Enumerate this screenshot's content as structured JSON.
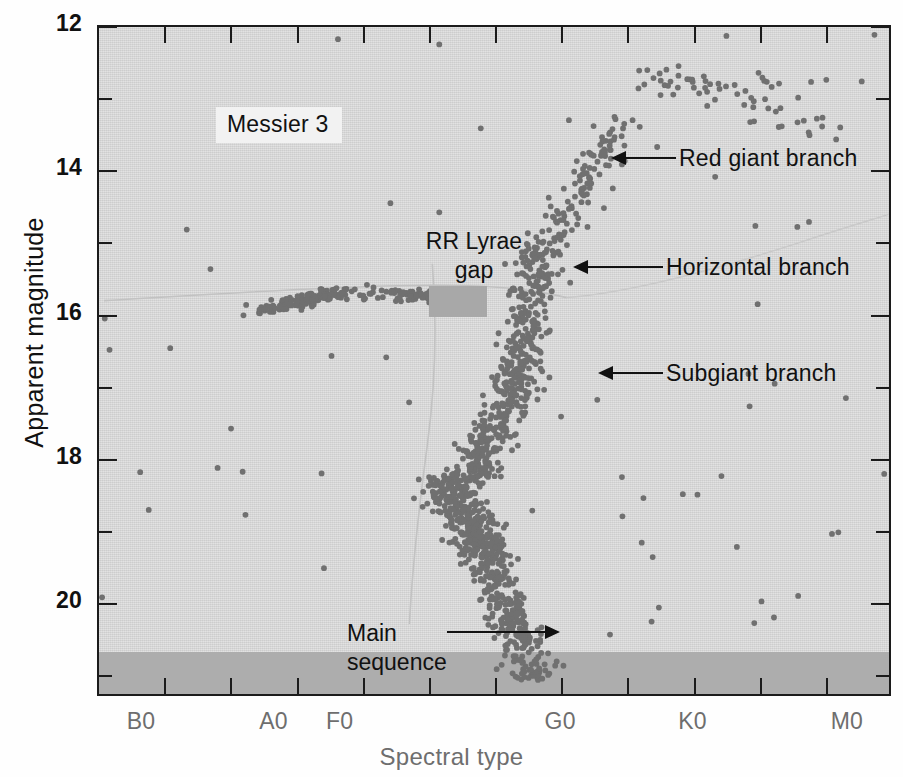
{
  "figure": {
    "cluster_name": "Messier 3",
    "x_axis_title": "Spectral type",
    "y_axis_title": "Apparent magnitude"
  },
  "annotations": [
    {
      "id": "red-giant-branch",
      "label": "Red giant branch",
      "x": 680,
      "y": 155,
      "arrow": "left"
    },
    {
      "id": "horizontal-branch",
      "label": "Horizontal branch",
      "x": 665,
      "y": 264,
      "arrow": "left"
    },
    {
      "id": "subgiant-branch",
      "label": "Subgiant branch",
      "x": 665,
      "y": 370,
      "arrow": "left"
    },
    {
      "id": "rr-lyrae-gap",
      "label": "RR Lyrae\ngap",
      "x": 375,
      "y": 215,
      "arrow": "none"
    },
    {
      "id": "main-sequence",
      "label": "Main\nsequence",
      "x": 305,
      "y": 612,
      "arrow": "right"
    }
  ],
  "labels": {
    "rr_lyrae_line1": "RR Lyrae",
    "rr_lyrae_line2": "gap",
    "main_sequence_line1": "Main",
    "main_sequence_line2": "sequence",
    "red_giant_branch": "Red giant branch",
    "horizontal_branch": "Horizontal branch",
    "subgiant_branch": "Subgiant branch"
  },
  "colors": {
    "plot_background": "#d9d9d9",
    "saturation_band": "#adadad",
    "star_marker": "#707070",
    "axis": "#1b1b1b",
    "x_tick_text": "#6e6e6e",
    "y_tick_text": "#111111",
    "rr_lyrae_box": "#a8a8a8",
    "name_box_background": "#f2f2f2"
  },
  "chart_data": {
    "type": "scatter",
    "title": "Messier 3",
    "xlabel": "Spectral type",
    "ylabel": "Apparent magnitude",
    "grid": false,
    "legend": "none",
    "y_ticks": [
      12,
      14,
      16,
      18,
      20
    ],
    "y_minor_ticks": [
      13,
      15,
      17,
      19,
      21
    ],
    "ylim": [
      12,
      21.3
    ],
    "y_inverted": true,
    "x_ticks": [
      "B0",
      "A0",
      "F0",
      "G0",
      "K0",
      "M0"
    ],
    "x_tick_positions": [
      0.5,
      2.0,
      2.75,
      5.25,
      6.75,
      8.5
    ],
    "xlim": [
      0,
      9
    ],
    "x_minor_tick_count": 12,
    "saturation_band_magnitude_range": [
      20.9,
      21.3
    ],
    "features": [
      {
        "name": "Main sequence",
        "spectral_range": [
          "F5",
          "G5"
        ],
        "magnitude_range": [
          19.0,
          21.0
        ]
      },
      {
        "name": "Turnoff point",
        "spectral_range": [
          "F2",
          "F8"
        ],
        "magnitude_range": [
          18.3,
          19.0
        ]
      },
      {
        "name": "Subgiant branch",
        "spectral_range": [
          "F8",
          "G4"
        ],
        "magnitude_range": [
          16.8,
          18.4
        ]
      },
      {
        "name": "Red giant branch",
        "spectral_range": [
          "G2",
          "M0"
        ],
        "magnitude_range": [
          12.6,
          16.5
        ]
      },
      {
        "name": "Horizontal branch",
        "spectral_range": [
          "A2",
          "G2"
        ],
        "magnitude_range": [
          15.6,
          16.0
        ]
      },
      {
        "name": "RR Lyrae gap",
        "spectral_range": [
          "F0",
          "F4"
        ],
        "magnitude_range": [
          15.5,
          15.9
        ]
      }
    ],
    "star_count_approx": 1100
  }
}
